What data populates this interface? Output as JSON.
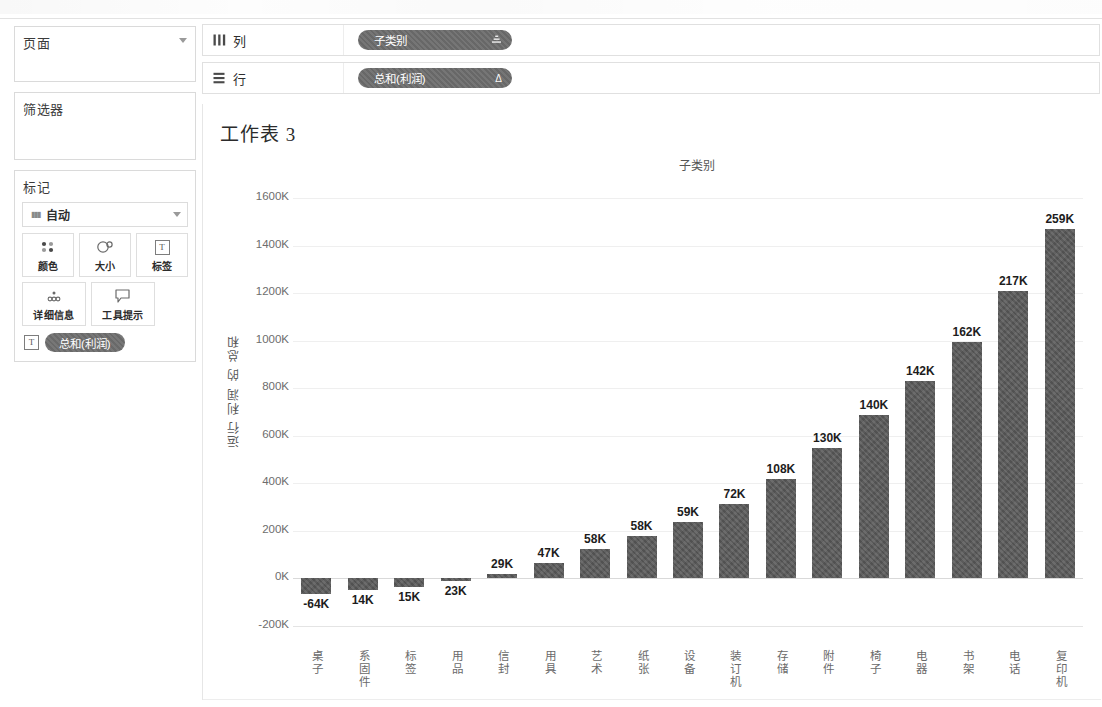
{
  "sidebar": {
    "pages": {
      "title": "页面",
      "caret_icon": "chevron-down-icon"
    },
    "filters": {
      "title": "筛选器"
    },
    "marks": {
      "title": "标记",
      "mark_type": "自动",
      "mark_type_icon": "bar-mark-icon",
      "buttons": [
        {
          "label": "颜色",
          "icon": "color-dots-icon"
        },
        {
          "label": "大小",
          "icon": "size-circle-icon"
        },
        {
          "label": "标签",
          "icon": "label-text-icon"
        },
        {
          "label": "详细信息",
          "icon": "detail-dots-icon"
        },
        {
          "label": "工具提示",
          "icon": "tooltip-bubble-icon"
        }
      ],
      "applied_pill": {
        "label": "总和(利润)",
        "icon": "label-text-icon"
      }
    }
  },
  "shelves": [
    {
      "name": "列",
      "icon": "columns-icon",
      "pill": "子类别",
      "pill_badge": "sort-icon"
    },
    {
      "name": "行",
      "icon": "rows-icon",
      "pill": "总和(利润)",
      "pill_badge": "Δ"
    }
  ],
  "worksheet": {
    "title": "工作表 3",
    "column_header": "子类别"
  },
  "chart_data": {
    "type": "bar",
    "title": "工作表 3",
    "xlabel": "子类别",
    "ylabel": "运行 利润 的 总和",
    "ylim": [
      -200000,
      1600000
    ],
    "ytick_labels": [
      "1600K",
      "1400K",
      "1200K",
      "1000K",
      "800K",
      "600K",
      "400K",
      "200K",
      "0K",
      "-200K"
    ],
    "ytick_values": [
      1600000,
      1400000,
      1200000,
      1000000,
      800000,
      600000,
      400000,
      200000,
      0,
      -200000
    ],
    "grid": true,
    "legend": "none",
    "note": "Bar heights are the running (cumulative) sum of profit; the printed label on each bar is that sub-category's own profit contribution.",
    "categories": [
      "桌子",
      "系固件",
      "标签",
      "用品",
      "信封",
      "用具",
      "艺术",
      "纸张",
      "设备",
      "装订机",
      "存储",
      "附件",
      "椅子",
      "电器",
      "书架",
      "电话",
      "复印机"
    ],
    "labels": [
      "-64K",
      "14K",
      "15K",
      "23K",
      "29K",
      "47K",
      "58K",
      "58K",
      "59K",
      "72K",
      "108K",
      "130K",
      "140K",
      "142K",
      "162K",
      "217K",
      "259K"
    ],
    "values": [
      -64000,
      14000,
      15000,
      23000,
      29000,
      47000,
      58000,
      58000,
      59000,
      72000,
      108000,
      130000,
      140000,
      142000,
      162000,
      217000,
      259000
    ],
    "running_sum": [
      -64000,
      -50000,
      -35000,
      -12000,
      17000,
      64000,
      122000,
      180000,
      239000,
      311000,
      419000,
      549000,
      689000,
      831000,
      993000,
      1210000,
      1469000
    ]
  }
}
